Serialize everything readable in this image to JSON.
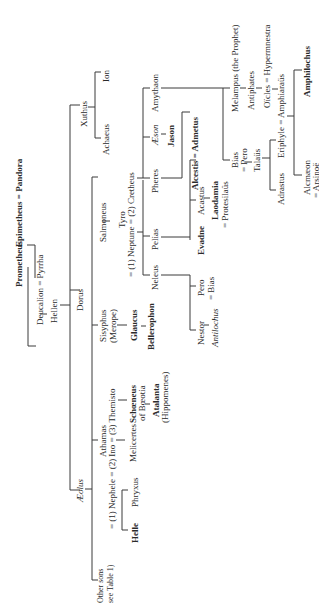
{
  "diagram": {
    "type": "genealogy-table",
    "orientation": "rotated-90-ccw",
    "nodes": {
      "prometheus": "Prometheus",
      "epimetheus_pandora": "Epimetheus = Pandora",
      "deucalion_pyrrha": "Deucalion = Pyrrha",
      "hellen": "Hellen",
      "xuthus": "Xuthus",
      "achaeus": "Achaeus",
      "ion": "Ion",
      "dorus": "Dorus",
      "aeolus": "Æolus",
      "other_sons_1": "Other sons",
      "other_sons_2": "see Table 1)",
      "athamas": "Athamas",
      "athamas_wives": "= (1) Nephele = (2) Ino = (3) Themisto",
      "helle": "Helle",
      "phryxus": "Phryxus",
      "melicertes": "Melicertes",
      "schoeneus": "Schœneus",
      "schoeneus_sub": "of Bœotia",
      "atalanta": "Atalanta",
      "atalanta_sub": "(Hippomenes)",
      "sisyphus": "Sisyphus",
      "sisyphus_sub": "(Merope)",
      "glaucus": "Glaucus",
      "bellerophon": "Bellerophon",
      "salmoneus": "Salmoneus",
      "tyro": "Tyro",
      "tyro_spouses": "= (1) Neptune = (2) Cretheus",
      "neleus": "Neleus",
      "pelias": "Pelias",
      "nestor": "Nestor",
      "antilochus": "Antilochus",
      "pero_bias_1": "Pero",
      "pero_bias_2": "= Bias",
      "evadne": "Evadne",
      "acastus": "Acastus",
      "laodamia": "Laodamia",
      "protesilaus": "= Protesilaüs",
      "alcestis_admetus": "Alcestis = Admetus",
      "pheres": "Pheres",
      "aeson": "Æson",
      "jason": "Jason",
      "amythaon": "Amythaon",
      "bias_pero_1": "Bias",
      "bias_pero_2": "= Pero",
      "talaus": "Talaüs",
      "adrastus": "Adrastus",
      "eriphyle_amphiaraus": "Eriphyle = Amphiaraüs",
      "alcmaeon": "Alcmæon",
      "arsinoe": "= Arsinoë",
      "amphilochus": "Amphilochus",
      "melampus": "Melampus (the Prophet)",
      "antiphates": "Antiphates",
      "oecles": "Oïcles = Hypermnestra"
    }
  }
}
